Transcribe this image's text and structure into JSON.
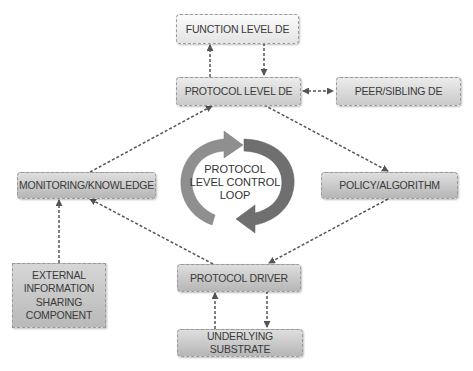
{
  "diagram": {
    "nodes": {
      "function_level_de": "FUNCTION LEVEL DE",
      "protocol_level_de": "PROTOCOL LEVEL DE",
      "peer_sibling_de": "PEER/SIBLING DE",
      "monitoring_knowledge": "MONITORING/KNOWLEDGE",
      "policy_algorithm": "POLICY/ALGORITHM",
      "external_info": [
        "EXTERNAL",
        "INFORMATION",
        "SHARING",
        "COMPONENT"
      ],
      "protocol_driver": "PROTOCOL DRIVER",
      "underlying_substrate": "UNDERLYING SUBSTRATE"
    },
    "center_loop": [
      "PROTOCOL",
      "LEVEL CONTROL",
      "LOOP"
    ],
    "edges": [
      {
        "from": "protocol_level_de",
        "to": "function_level_de"
      },
      {
        "from": "function_level_de",
        "to": "protocol_level_de"
      },
      {
        "from": "protocol_level_de",
        "to": "peer_sibling_de",
        "bidirectional": true
      },
      {
        "from": "protocol_level_de",
        "to": "policy_algorithm"
      },
      {
        "from": "policy_algorithm",
        "to": "protocol_driver"
      },
      {
        "from": "protocol_driver",
        "to": "monitoring_knowledge"
      },
      {
        "from": "monitoring_knowledge",
        "to": "protocol_level_de"
      },
      {
        "from": "external_info",
        "to": "monitoring_knowledge"
      },
      {
        "from": "underlying_substrate",
        "to": "protocol_driver"
      },
      {
        "from": "protocol_driver",
        "to": "underlying_substrate"
      }
    ],
    "colors": {
      "edge": "#555555",
      "loop_arrow": "#8c8c8c",
      "text": "#3a3a3a"
    }
  }
}
